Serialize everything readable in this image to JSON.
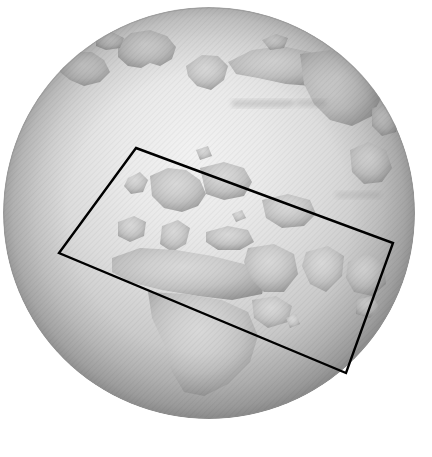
{
  "view": {
    "width": 432,
    "height": 457,
    "background_color": "#ffffff",
    "title": "Orthographic globe with rotated region-of-interest box",
    "color_mode": "grayscale"
  },
  "globe": {
    "name": "earth-globe",
    "projection": "orthographic",
    "center_x": 209,
    "center_y": 213,
    "radius": 206,
    "ocean_color": "#a8a8a8",
    "ocean_highlight_color": "#efefef",
    "land_color": "#cfcfcf",
    "land_shadow_color": "#8d8d8d",
    "limb_color": "#9a9a9a",
    "texture": "diagonal-hatch-scan-lines",
    "texture_angle_deg": 45,
    "lighting": "limb-darkening, bright near upper-center",
    "visible_landmasses": [
      "Greenland",
      "Northern Canada",
      "Scandinavia",
      "Europe",
      "Mediterranean",
      "North Africa",
      "Sub-Saharan Africa",
      "Arabian Peninsula",
      "Siberia",
      "Central Asia",
      "India",
      "Southeast Asia"
    ]
  },
  "selection_box": {
    "name": "region-of-interest-box",
    "shape": "rotated-rectangle",
    "stroke_color": "#000000",
    "stroke_width": 2.4,
    "fill": "none",
    "rotation_deg": 20.3,
    "corners": [
      {
        "label": "top-left",
        "x": 136,
        "y": 148
      },
      {
        "label": "top-right",
        "x": 393,
        "y": 243
      },
      {
        "label": "bottom-right",
        "x": 346,
        "y": 373
      },
      {
        "label": "bottom-left",
        "x": 59,
        "y": 253
      }
    ]
  },
  "annotations": {
    "faint_marking_present": true,
    "faint_marking_region": "central-asia"
  }
}
